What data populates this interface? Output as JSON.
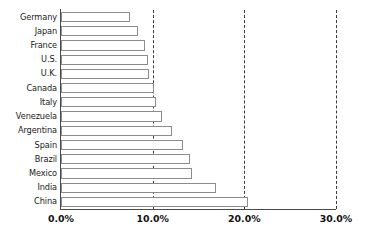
{
  "chart_data": {
    "type": "bar",
    "orientation": "horizontal",
    "title": "",
    "xlabel": "",
    "ylabel": "",
    "xlim": [
      0,
      30
    ],
    "xticks": [
      0,
      10,
      20,
      30
    ],
    "xtick_labels": [
      "0.0%",
      "10.0%",
      "20.0%",
      "30.0%"
    ],
    "grid": "vertical-dashed",
    "legend": "none",
    "value_unit": "%",
    "categories": [
      "Germany",
      "Japan",
      "France",
      "U.S.",
      "U.K.",
      "Canada",
      "Italy",
      "Venezuela",
      "Argentina",
      "Spain",
      "Brazil",
      "Mexico",
      "India",
      "China"
    ],
    "values": [
      7.5,
      8.4,
      9.2,
      9.5,
      9.6,
      10.1,
      10.4,
      11.0,
      12.1,
      13.3,
      14.1,
      14.3,
      16.9,
      20.4
    ],
    "series": [
      {
        "name": "Share",
        "values": [
          7.5,
          8.4,
          9.2,
          9.5,
          9.6,
          10.1,
          10.4,
          11.0,
          12.1,
          13.3,
          14.1,
          14.3,
          16.9,
          20.4
        ]
      }
    ],
    "colors": {
      "bar_fill": "#ffffff",
      "bar_stroke": "#8c8c8c",
      "axis": "#4a4a4a",
      "gridline": "#3a3a3a",
      "text": "#1a1a1a",
      "background": "#ffffff"
    }
  }
}
